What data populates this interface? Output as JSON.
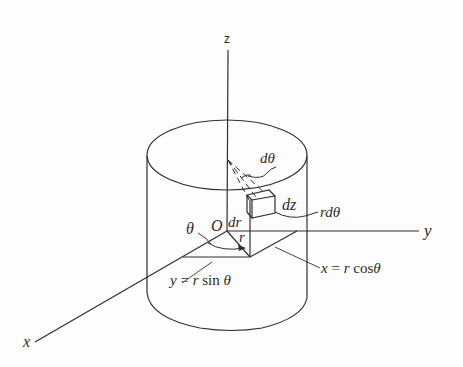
{
  "diagram": {
    "axes": {
      "z": "z",
      "y": "y",
      "x": "x"
    },
    "labels": {
      "origin": "O",
      "theta": "θ",
      "r": "r",
      "dr": "dr",
      "dz": "dz",
      "dtheta": "dθ",
      "rdtheta": "rdθ"
    },
    "equations": {
      "y_eq": {
        "lhs": "y",
        "eq": " = ",
        "rhs_var": "r",
        "rhs_fn": " sin ",
        "rhs_arg": "θ"
      },
      "x_eq": {
        "lhs": "x",
        "eq": " = ",
        "rhs_var": "r",
        "rhs_fn": " cos",
        "rhs_arg": "θ"
      }
    },
    "colors": {
      "stroke": "#2f2f2f",
      "text": "#2a2a2a",
      "background": "#fdfdfd"
    }
  }
}
